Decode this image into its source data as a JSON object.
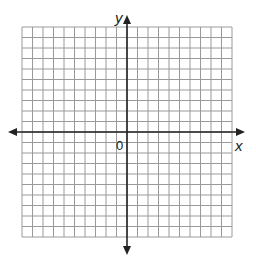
{
  "diagram": {
    "type": "coordinate-grid",
    "grid": {
      "columns": 20,
      "rows": 20,
      "line_color": "#9a9a9a",
      "axis_color": "#222222"
    },
    "labels": {
      "x_axis": "x",
      "y_axis": "y",
      "origin": "0"
    }
  }
}
